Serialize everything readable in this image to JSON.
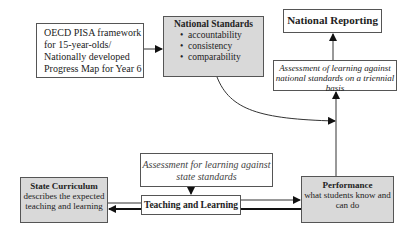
{
  "diagram": {
    "nodes": {
      "oecd": {
        "lines": [
          "OECD PISA framework",
          "for 15-year-olds/",
          "Nationally developed",
          "Progress Map for Year 6"
        ]
      },
      "national_standards": {
        "title": "National Standards",
        "bullets": [
          "accountability",
          "consistency",
          "comparability"
        ]
      },
      "national_reporting": {
        "title": "National Reporting"
      },
      "assessment_national": {
        "text": "Assessment of learning against national standards on a triennial basis"
      },
      "assessment_state": {
        "text": "Assessment for learning against state standards"
      },
      "teaching_learning": {
        "title": "Teaching and Learning"
      },
      "state_curriculum": {
        "title": "State Curriculum",
        "text": "describes the expected teaching and learning"
      },
      "performance": {
        "title": "Performance",
        "text": "what students know and can do"
      }
    },
    "edges": [
      {
        "from": "oecd",
        "to": "national_standards"
      },
      {
        "from": "national_standards",
        "to": "assessment_national"
      },
      {
        "from": "performance",
        "to": "assessment_national"
      },
      {
        "from": "assessment_national",
        "to": "national_reporting"
      },
      {
        "from": "assessment_state",
        "to": "teaching_learning"
      },
      {
        "from": "teaching_learning",
        "to": "performance"
      },
      {
        "from": "performance",
        "to": "state_curriculum"
      }
    ],
    "colors": {
      "shaded_box": "#d9d9d9",
      "line": "#333333"
    }
  }
}
